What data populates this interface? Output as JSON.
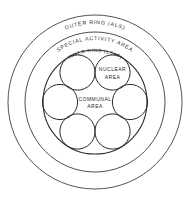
{
  "diagram": {
    "type": "concentric-zone-plan",
    "rings": [
      {
        "id": "outer-ring",
        "label": "OUTER RING (ALS)",
        "name": "OUTER RING",
        "code": "ALS",
        "radius_px": 87
      },
      {
        "id": "special-activity-area",
        "label": "SPECIAL ACTIVITY AREA",
        "name": "SPECIAL ACTIVITY AREA",
        "code": "",
        "radius_px": 70
      },
      {
        "id": "inner-ring",
        "label": "INNER RING (LSAT)",
        "name": "INNER RING",
        "code": "LSAT",
        "radius_px": 52
      }
    ],
    "petals": [
      {
        "id": "petal-top-left",
        "label": "",
        "angle_deg": 240
      },
      {
        "id": "petal-top-right",
        "label": "NUCLEAR AREA",
        "angle_deg": 300
      },
      {
        "id": "petal-right",
        "label": "",
        "angle_deg": 0
      },
      {
        "id": "petal-bottom-right",
        "label": "",
        "angle_deg": 60
      },
      {
        "id": "petal-bottom-left",
        "label": "",
        "angle_deg": 120
      },
      {
        "id": "petal-left",
        "label": "",
        "angle_deg": 180
      }
    ],
    "center_area": {
      "id": "communal-area",
      "label_line_1": "COMMUNAL",
      "label_line_2": "AREA"
    },
    "nuclear_area": {
      "id": "nuclear-area",
      "label_line_1": "NUCLEAR",
      "label_line_2": "AREA"
    },
    "colors": {
      "background": "#ffffff",
      "stroke": "#2a2a2a",
      "stroke_light": "#404040",
      "text": "#2e2e2e"
    }
  }
}
